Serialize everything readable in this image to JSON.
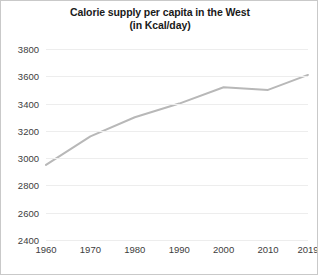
{
  "chart_data": {
    "type": "line",
    "title": "Calorie supply per capita in the West",
    "subtitle": "(in Kcal/day)",
    "title_line1": "Calorie supply per capita in the West",
    "title_line2": "(in Kcal/day)",
    "xlabel": "",
    "ylabel": "",
    "x": [
      1960,
      1970,
      1980,
      1990,
      2000,
      2010,
      2019
    ],
    "categories": [
      "1960",
      "1970",
      "1980",
      "1990",
      "2000",
      "2010",
      "2019"
    ],
    "values": [
      2950,
      3160,
      3300,
      3400,
      3520,
      3500,
      3610
    ],
    "series": [
      {
        "name": "Calorie supply per capita in the West",
        "values": [
          2950,
          3160,
          3300,
          3400,
          3520,
          3500,
          3610
        ],
        "color": "#b8b8b8"
      }
    ],
    "ylim": [
      2400,
      3800
    ],
    "yticks": [
      2400,
      2600,
      2800,
      3000,
      3200,
      3400,
      3600,
      3800
    ],
    "ytick_labels": [
      "2400",
      "2600",
      "2800",
      "3000",
      "3200",
      "3400",
      "3600",
      "3800"
    ],
    "xlim": [
      1960,
      2019
    ],
    "xticks": [
      1960,
      1970,
      1980,
      1990,
      2000,
      2010,
      2019
    ],
    "xtick_labels": [
      "1960",
      "1970",
      "1980",
      "1990",
      "2000",
      "2010",
      "2019"
    ],
    "grid": true,
    "grid_axis": "y",
    "grid_color": "#ededed",
    "legend": false,
    "legend_position": "none",
    "line_color": "#b8b8b8",
    "line_width": 2,
    "markers": false,
    "background": "#ffffff",
    "border_color": "#c9c9c9",
    "annotations": []
  }
}
